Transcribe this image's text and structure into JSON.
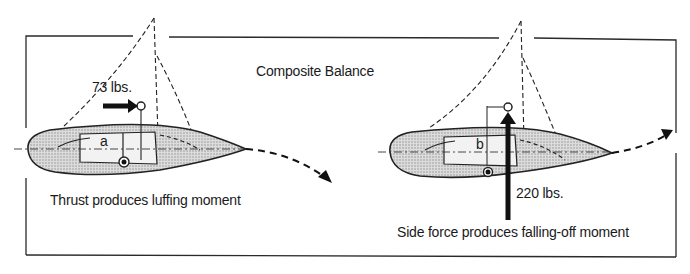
{
  "title": "Composite Balance",
  "left_panel": {
    "force_label": "73 lbs.",
    "dimension_label": "a",
    "caption": "Thrust produces luffing moment",
    "force_type": "thrust",
    "arrow_direction": "right"
  },
  "right_panel": {
    "force_label": "220 lbs.",
    "dimension_label": "b",
    "caption": "Side force produces falling-off moment",
    "force_type": "side force",
    "arrow_direction": "up"
  },
  "colors": {
    "ink": "#1a1a1a",
    "hull_fill": "#c8c8c8",
    "background": "#ffffff"
  }
}
